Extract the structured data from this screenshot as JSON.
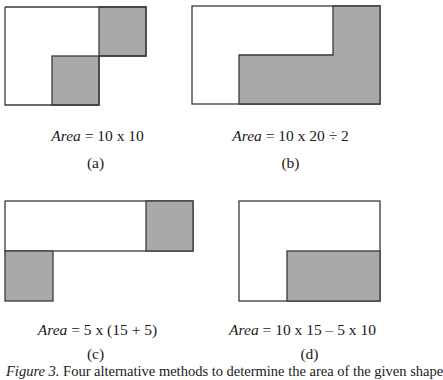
{
  "colors": {
    "shade": "#a9a9a9",
    "stroke": "#3a3a3a",
    "background": "#ffffff"
  },
  "panels": [
    {
      "id": "a",
      "label": "(a)",
      "formula_var": "Area",
      "formula_expr": " = 10 x 10",
      "description": "Upper-right and lower-middle squares shaded within an L-shaped outline"
    },
    {
      "id": "b",
      "label": "(b)",
      "formula_var": "Area",
      "formula_expr": " = 10 x 20 ÷ 2",
      "description": "L-shaped step region shaded inside a full rectangle"
    },
    {
      "id": "c",
      "label": "(c)",
      "formula_var": "Area",
      "formula_expr": " = 5 x (15 + 5)",
      "description": "Long top strip with shaded right square plus shaded bottom-left square"
    },
    {
      "id": "d",
      "label": "(d)",
      "formula_var": "Area",
      "formula_expr": " = 10 x 15 – 5 x 10",
      "description": "Rectangle with shaded lower-right sub-rectangle"
    }
  ],
  "caption": {
    "figure_label": "Figure 3.",
    "text": " Four alternative methods to determine the area of the given shape"
  }
}
